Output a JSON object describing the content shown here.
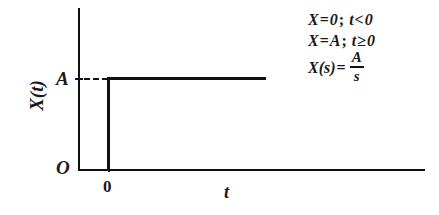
{
  "figure": {
    "type": "step-function-plot",
    "axes": {
      "y_axis_label": "X(t)",
      "x_axis_label": "t",
      "origin_label": "O",
      "y_tick_label": "A",
      "x_tick_label": "0"
    },
    "equations": [
      {
        "lhs": "X",
        "eq": "=",
        "rhs": "0",
        "separator": ";",
        "condition_var": "t",
        "condition_op": "<",
        "condition_value": "0",
        "text": "X = 0; t < 0"
      },
      {
        "lhs": "X",
        "eq": "=",
        "rhs": "A",
        "separator": ";",
        "condition_var": "t",
        "condition_op": "≥",
        "condition_value": "0",
        "text": "X = A; t ≥ 0"
      },
      {
        "lhs": "X(s)",
        "eq": "=",
        "numerator": "A",
        "denominator": "s",
        "text": "X(s) = A/s"
      }
    ],
    "colors": {
      "ink": "#111111",
      "background": "#ffffff"
    }
  },
  "chart_data": {
    "type": "line",
    "title": "",
    "xlabel": "t",
    "ylabel": "X(t)",
    "xlim": [
      -0.35,
      3.6
    ],
    "ylim": [
      0,
      1.35
    ],
    "grid": false,
    "legend": null,
    "x_ticks": [
      0
    ],
    "x_tick_labels": [
      "0"
    ],
    "y_ticks": [
      1
    ],
    "y_tick_labels": [
      "A"
    ],
    "origin_label": "O",
    "annotations": [
      "X = 0; t < 0",
      "X = A; t ≥ 0",
      "X(s) = A/s"
    ],
    "series": [
      {
        "name": "X(t)",
        "style": "solid",
        "x": [
          0,
          0,
          1.7
        ],
        "y": [
          0,
          1,
          1
        ]
      },
      {
        "name": "A level guide",
        "style": "dashed",
        "x": [
          0,
          0
        ],
        "y": [
          1,
          1
        ]
      }
    ]
  }
}
